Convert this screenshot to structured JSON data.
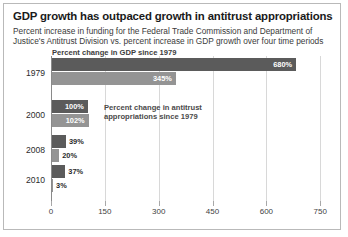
{
  "header": {
    "title": "GDP growth has outpaced growth in antitrust appropriations",
    "subtitle": "Percent increase in funding for the Federal Trade Commission and Department of Justice's Antitrust Division vs. percent increase in GDP growth over four time periods"
  },
  "annotations": {
    "gdp": "Percent change in GDP since 1979",
    "antitrust": "Percent change in antitrust\nappropriations since 1979"
  },
  "colors": {
    "gdp": "#5b5b5b",
    "antitrust": "#949494",
    "grid": "#d8d8d8",
    "axis": "#8a8a8a",
    "border": "#b9b9b9",
    "title": "#1a1a1a"
  },
  "chart_data": {
    "type": "bar",
    "orientation": "horizontal",
    "title": "GDP growth has outpaced growth in antitrust appropriations",
    "subtitle": "Percent increase in funding for the Federal Trade Commission and Department of Justice's Antitrust Division vs. percent increase in GDP growth over four time periods",
    "categories": [
      "1979",
      "2000",
      "2008",
      "2010"
    ],
    "series": [
      {
        "name": "Percent change in GDP since 1979",
        "color": "#5b5b5b",
        "values": [
          680,
          100,
          39,
          37
        ],
        "labels": [
          "680%",
          "100%",
          "39%",
          "37%"
        ]
      },
      {
        "name": "Percent change in antitrust appropriations since 1979",
        "color": "#949494",
        "values": [
          345,
          102,
          20,
          3
        ],
        "labels": [
          "345%",
          "102%",
          "20%",
          "3%"
        ]
      }
    ],
    "xlabel": "",
    "ylabel": "",
    "xlim": [
      0,
      780
    ],
    "xticks": [
      0,
      150,
      300,
      450,
      600,
      750
    ],
    "xticklabels": [
      "0",
      "150",
      "300",
      "450",
      "600",
      "750"
    ],
    "grid": true,
    "legend": "annotations-inline"
  }
}
